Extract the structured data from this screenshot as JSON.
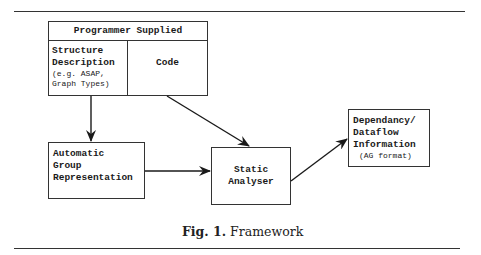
{
  "figure": {
    "caption_label": "Fig. 1.",
    "caption_text": "Framework"
  },
  "boxes": {
    "programmer": {
      "header": "Programmer Supplied",
      "structure_title_1": "Structure",
      "structure_title_2": "Description",
      "structure_note_1": "(e.g. ASAP,",
      "structure_note_2": "Graph Types)",
      "code": "Code"
    },
    "automatic": {
      "line1": "Automatic",
      "line2": "Group",
      "line3": "Representation"
    },
    "static": {
      "line1": "Static",
      "line2": "Analyser"
    },
    "dependency": {
      "line1": "Dependancy/",
      "line2": "Dataflow",
      "line3": "Information",
      "note": "(AG format)"
    }
  },
  "edges": [
    {
      "from": "structure-description",
      "to": "automatic-group-representation"
    },
    {
      "from": "code",
      "to": "static-analyser"
    },
    {
      "from": "automatic-group-representation",
      "to": "static-analyser"
    },
    {
      "from": "static-analyser",
      "to": "dependency-dataflow-information"
    }
  ]
}
